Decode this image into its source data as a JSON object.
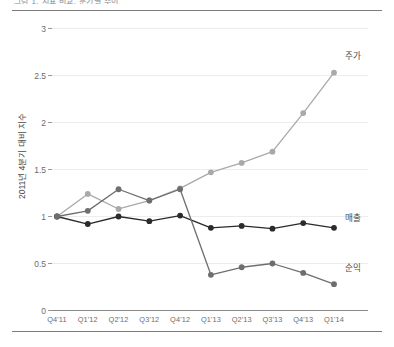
{
  "figure": {
    "caption_clipped": "그림 1. 지표 비교, 분기별 추이",
    "ylabel": "2011년 4분기 대비 지수"
  },
  "chart_data": {
    "type": "line",
    "title": "",
    "xlabel": "",
    "ylabel": "2011년 4분기 대비 지수",
    "categories": [
      "Q4'11",
      "Q1'12",
      "Q2'12",
      "Q3'12",
      "Q4'12",
      "Q1'13",
      "Q2'13",
      "Q3'13",
      "Q4'13",
      "Q1'14"
    ],
    "ylim": [
      0,
      3
    ],
    "yticks": [
      0,
      0.5,
      1,
      1.5,
      2,
      2.5,
      3
    ],
    "ytick_labels": [
      "0",
      "0.5",
      "1",
      "1.5",
      "2",
      "2.5",
      "3"
    ],
    "grid": true,
    "legend_position": "right-inline",
    "series": [
      {
        "name": "주가",
        "color": "#a9a9a9",
        "label_y": 2.72,
        "values": [
          1.0,
          1.24,
          1.08,
          1.17,
          1.3,
          1.47,
          1.57,
          1.69,
          2.1,
          2.53
        ]
      },
      {
        "name": "매출",
        "color": "#2b2b2b",
        "label_y": 1.0,
        "values": [
          1.0,
          0.92,
          1.0,
          0.95,
          1.01,
          0.88,
          0.9,
          0.87,
          0.93,
          0.88
        ]
      },
      {
        "name": "순익",
        "color": "#6e6e6e",
        "label_y": 0.46,
        "values": [
          1.0,
          1.06,
          1.29,
          1.17,
          1.29,
          0.38,
          0.46,
          0.5,
          0.4,
          0.28
        ]
      }
    ]
  }
}
